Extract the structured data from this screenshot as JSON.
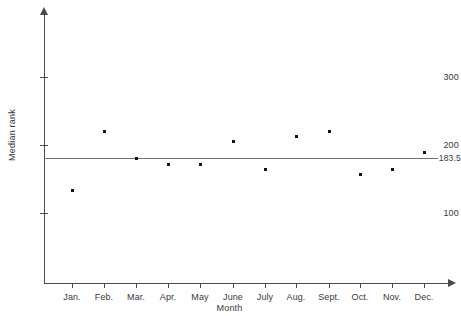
{
  "chart_data": {
    "type": "scatter",
    "title": "",
    "xlabel": "Month",
    "ylabel": "Median rank",
    "categories": [
      "Jan.",
      "Feb.",
      "Mar.",
      "Apr.",
      "May",
      "June",
      "July",
      "Aug.",
      "Sept.",
      "Oct.",
      "Nov.",
      "Dec."
    ],
    "values": [
      134,
      221,
      181,
      172,
      172,
      206,
      165,
      213,
      221,
      157,
      165,
      190
    ],
    "series": [
      {
        "name": "Median rank",
        "values": [
          134,
          221,
          181,
          172,
          172,
          206,
          165,
          213,
          221,
          157,
          165,
          190
        ]
      }
    ],
    "ylim": [
      0,
      340
    ],
    "xlim": [
      0,
      13
    ],
    "ytick_labels": [
      "100",
      "200",
      "300"
    ],
    "ytick_values": [
      100,
      200,
      300
    ],
    "xtick_labels": [
      "Jan.",
      "Feb.",
      "Mar.",
      "Apr.",
      "May",
      "June",
      "July",
      "Aug.",
      "Sept.",
      "Oct.",
      "Nov.",
      "Dec."
    ],
    "grid": false,
    "legend": "none",
    "reference_line": {
      "label": "183.5",
      "value": 183.5,
      "orientation": "horizontal",
      "color": "#6f6f6f"
    },
    "marker": {
      "shape": "square",
      "color": "#141414",
      "size": 3
    },
    "axis_color": "#4a4a4a",
    "background": "#fefefe"
  },
  "axes": {
    "y_title": "Median rank",
    "x_title": "Month"
  }
}
